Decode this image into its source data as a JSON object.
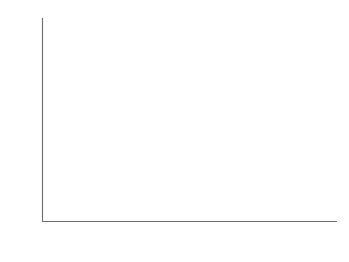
{
  "chart_data": {
    "type": "line",
    "title": "",
    "subtitle": "",
    "xlabel": "年",
    "ylabel": "国の数",
    "ylabel_chars": [
      "国",
      "の",
      "数"
    ],
    "xlim": [
      1890,
      2010
    ],
    "ylim": [
      0,
      200
    ],
    "xticks": [
      1890,
      1920,
      1950,
      1980,
      2010
    ],
    "xtick_labels": [
      "1890",
      "1920",
      "1950",
      "1980",
      "2010"
    ],
    "yticks": [
      0,
      50,
      100,
      150,
      200
    ],
    "ytick_labels": [
      "0",
      "50",
      "100",
      "150",
      "200"
    ],
    "grid": "horizontal",
    "legend": "none",
    "series": [
      {
        "name": "国の数",
        "color": "#2b2b2b",
        "x": [
          1890,
          1894,
          1898,
          1902,
          1906,
          1910,
          1914,
          1918,
          1919,
          1920,
          1921,
          1922,
          1924,
          1926,
          1928,
          1930,
          1932,
          1934,
          1936,
          1938,
          1940,
          1942,
          1944,
          1945,
          1946,
          1947,
          1948,
          1949,
          1950,
          1952,
          1954,
          1956,
          1958,
          1960,
          1961,
          1962,
          1964,
          1966,
          1968,
          1970,
          1972,
          1974,
          1976,
          1978,
          1980,
          1982,
          1984,
          1986,
          1988,
          1990,
          1991,
          1992,
          1993,
          1995,
          1998,
          2002,
          2006,
          2008
        ],
        "y": [
          0,
          1,
          2,
          3,
          4,
          5,
          6,
          7,
          10,
          13,
          14,
          15,
          16,
          17,
          19,
          22,
          25,
          26,
          27,
          28,
          29,
          28,
          27,
          29,
          34,
          40,
          48,
          55,
          62,
          70,
          76,
          83,
          90,
          98,
          103,
          106,
          113,
          120,
          126,
          131,
          136,
          140,
          143,
          147,
          152,
          155,
          156,
          157,
          157,
          158,
          162,
          170,
          176,
          177,
          178,
          179,
          179,
          179
        ]
      }
    ],
    "shading": {
      "description": "light gray background band beneath and around the plotted curve",
      "color": "#eeeeee"
    }
  }
}
